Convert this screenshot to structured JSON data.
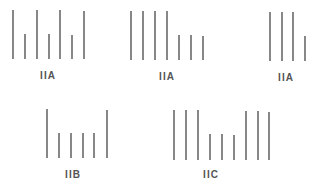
{
  "diagram": {
    "type": "vertical line patterns",
    "line_color": "#6a6a6a",
    "label_color": "#555555",
    "groups": [
      {
        "label": "IIA",
        "label_x": 48,
        "label_y": 70,
        "bottom": 59,
        "bars": [
          {
            "x": 13,
            "top": 10
          },
          {
            "x": 25,
            "top": 34
          },
          {
            "x": 37,
            "top": 10
          },
          {
            "x": 49,
            "top": 34
          },
          {
            "x": 60,
            "top": 10
          },
          {
            "x": 72,
            "top": 35
          },
          {
            "x": 84,
            "top": 11
          }
        ]
      },
      {
        "label": "IIA",
        "label_x": 167,
        "label_y": 71,
        "bottom": 60,
        "bars": [
          {
            "x": 131,
            "top": 11
          },
          {
            "x": 143,
            "top": 11
          },
          {
            "x": 155,
            "top": 11
          },
          {
            "x": 167,
            "top": 11
          },
          {
            "x": 179,
            "top": 35
          },
          {
            "x": 191,
            "top": 35
          },
          {
            "x": 203,
            "top": 36
          }
        ]
      },
      {
        "label": "IIA",
        "label_x": 286,
        "label_y": 72,
        "bottom": 61,
        "bars": [
          {
            "x": 270,
            "top": 12
          },
          {
            "x": 282,
            "top": 12
          },
          {
            "x": 293,
            "top": 12
          },
          {
            "x": 305,
            "top": 36
          }
        ]
      },
      {
        "label": "IIB",
        "label_x": 73,
        "label_y": 169,
        "bottom": 158,
        "bars": [
          {
            "x": 47,
            "top": 109
          },
          {
            "x": 59,
            "top": 133
          },
          {
            "x": 71,
            "top": 133
          },
          {
            "x": 83,
            "top": 133
          },
          {
            "x": 94,
            "top": 133
          },
          {
            "x": 107,
            "top": 110
          }
        ]
      },
      {
        "label": "IIC",
        "label_x": 211,
        "label_y": 169,
        "bottom": 160,
        "bars": [
          {
            "x": 174,
            "top": 110
          },
          {
            "x": 186,
            "top": 110
          },
          {
            "x": 198,
            "top": 110
          },
          {
            "x": 210,
            "top": 134
          },
          {
            "x": 222,
            "top": 134
          },
          {
            "x": 234,
            "top": 135
          },
          {
            "x": 246,
            "top": 111
          },
          {
            "x": 258,
            "top": 111
          },
          {
            "x": 269,
            "top": 112
          }
        ]
      }
    ]
  }
}
